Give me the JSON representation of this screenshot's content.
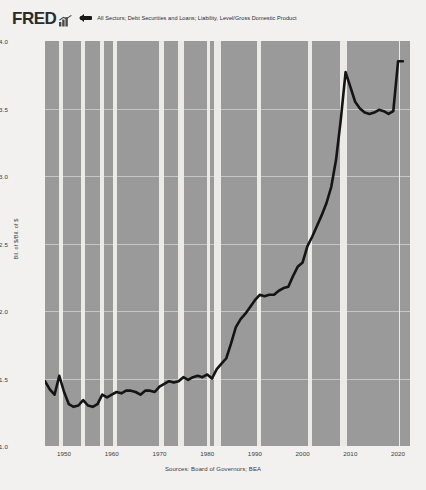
{
  "header": {
    "logo_text": "FRED",
    "logo_mark": "bar-chart-mark",
    "series_label": "All Sectors; Debt Securities and Loans; Liability, Level/Gross Domestic Product"
  },
  "axes": {
    "ylabel": "Bil. of $/Bil. of $",
    "yticks": [
      "4.0",
      "3.5",
      "3.0",
      "2.5",
      "2.0",
      "1.5",
      "1.0"
    ],
    "xticks": [
      "1950",
      "1960",
      "1970",
      "1980",
      "1990",
      "2000",
      "2010",
      "2020"
    ]
  },
  "footer": {
    "sources": "Sources: Board of Governors; BEA"
  },
  "colors": {
    "page_background": "#f2f1ef",
    "plot_background": "#9a9a9a",
    "recession_band": "#ebeae7",
    "line": "#141414",
    "text": "#2a2a2a"
  },
  "chart_data": {
    "type": "line",
    "title": "All Sectors; Debt Securities and Loans; Liability, Level/Gross Domestic Product",
    "xlabel": "",
    "ylabel": "Bil. of $/Bil. of $",
    "xlim": [
      1946,
      2022.5
    ],
    "ylim": [
      1.0,
      4.0
    ],
    "grid": true,
    "legend_position": "top",
    "series": [
      {
        "name": "All Sectors; Debt Securities and Loans; Liability, Level/Gross Domestic Product",
        "x": [
          1946,
          1947,
          1948,
          1949,
          1950,
          1951,
          1952,
          1953,
          1954,
          1955,
          1956,
          1957,
          1958,
          1959,
          1960,
          1961,
          1962,
          1963,
          1964,
          1965,
          1966,
          1967,
          1968,
          1969,
          1970,
          1971,
          1972,
          1973,
          1974,
          1975,
          1976,
          1977,
          1978,
          1979,
          1980,
          1981,
          1982,
          1983,
          1984,
          1985,
          1986,
          1987,
          1988,
          1989,
          1990,
          1991,
          1992,
          1993,
          1994,
          1995,
          1996,
          1997,
          1998,
          1999,
          2000,
          2001,
          2002,
          2003,
          2004,
          2005,
          2006,
          2007,
          2008,
          2009,
          2010,
          2011,
          2012,
          2013,
          2014,
          2015,
          2016,
          2017,
          2018,
          2019,
          2020,
          2021
        ],
        "values": [
          1.48,
          1.42,
          1.38,
          1.52,
          1.4,
          1.31,
          1.29,
          1.3,
          1.34,
          1.3,
          1.29,
          1.31,
          1.38,
          1.36,
          1.38,
          1.4,
          1.39,
          1.41,
          1.41,
          1.4,
          1.38,
          1.41,
          1.41,
          1.4,
          1.44,
          1.46,
          1.48,
          1.47,
          1.48,
          1.51,
          1.49,
          1.51,
          1.52,
          1.51,
          1.53,
          1.5,
          1.57,
          1.61,
          1.65,
          1.76,
          1.88,
          1.94,
          1.98,
          2.03,
          2.08,
          2.12,
          2.11,
          2.12,
          2.12,
          2.15,
          2.17,
          2.18,
          2.26,
          2.33,
          2.36,
          2.48,
          2.55,
          2.63,
          2.71,
          2.8,
          2.92,
          3.12,
          3.42,
          3.77,
          3.66,
          3.55,
          3.5,
          3.47,
          3.46,
          3.47,
          3.49,
          3.48,
          3.46,
          3.48,
          3.85,
          3.85
        ]
      }
    ],
    "recessions": [
      {
        "start": 1948.9,
        "end": 1949.8
      },
      {
        "start": 1953.5,
        "end": 1954.4
      },
      {
        "start": 1957.6,
        "end": 1958.3
      },
      {
        "start": 1960.3,
        "end": 1961.1
      },
      {
        "start": 1969.9,
        "end": 1970.9
      },
      {
        "start": 1973.9,
        "end": 1975.2
      },
      {
        "start": 1980.0,
        "end": 1980.5
      },
      {
        "start": 1981.5,
        "end": 1982.9
      },
      {
        "start": 1990.5,
        "end": 1991.2
      },
      {
        "start": 2001.2,
        "end": 2001.9
      },
      {
        "start": 2007.9,
        "end": 2009.4
      },
      {
        "start": 2020.1,
        "end": 2020.4
      }
    ]
  }
}
